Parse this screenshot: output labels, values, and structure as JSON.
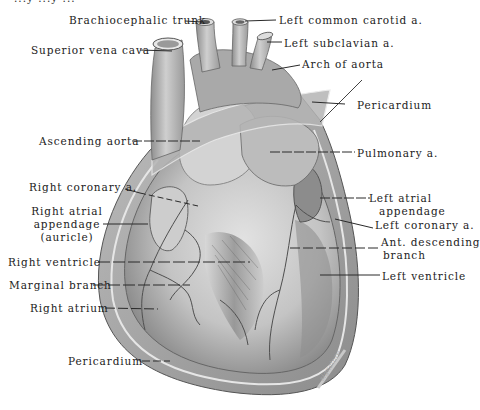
{
  "figure": {
    "title_fragment": "...y  ...y ...",
    "artist_signature": "signature",
    "colors": {
      "background": "#ffffff",
      "label_text": "#222222",
      "leader_line": "#2a2a2a",
      "tissue_light": "#d9d9d9",
      "tissue_mid": "#a8a8a8",
      "tissue_dark": "#6e6e6e"
    }
  },
  "labels": {
    "brachiocephalic_trunk": "Brachiocephalic trunk",
    "left_common_carotid": "Left common carotid a.",
    "superior_vena_cava": "Superior vena cava",
    "left_subclavian": "Left subclavian a.",
    "arch_of_aorta": "Arch of aorta",
    "pericardium_top": "Pericardium",
    "ascending_aorta": "Ascending aorta",
    "pulmonary_a": "Pulmonary a.",
    "right_coronary": "Right coronary a.",
    "right_atrial_appendage_1": "Right atrial",
    "right_atrial_appendage_2": "appendage",
    "right_atrial_appendage_3": "(auricle)",
    "left_atrial_appendage_1": "Left atrial",
    "left_atrial_appendage_2": "appendage",
    "left_coronary": "Left coronary a.",
    "ant_descending_1": "Ant. descending",
    "ant_descending_2": "branch",
    "right_ventricle": "Right ventricle",
    "left_ventricle": "Left ventricle",
    "marginal_branch": "Marginal branch",
    "right_atrium": "Right atrium",
    "pericardium_bottom": "Pericardium"
  }
}
